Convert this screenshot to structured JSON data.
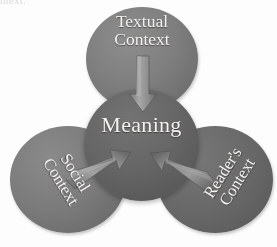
{
  "figure": {
    "cutoff_running_text": "ntext.",
    "background_color": "#fdfdfd"
  },
  "nodes": {
    "textual": {
      "label": "Textual\nContext",
      "fill_color": "#7e7e7e",
      "text_color": "#f4f3f0"
    },
    "meaning": {
      "label": "Meaning",
      "fill_color": "#666666",
      "text_color": "#f4f3f0"
    },
    "social": {
      "label": "Social\nContext",
      "fill_color": "#7b7b7b",
      "text_color": "#f4f3f0",
      "rotation_degrees": 58
    },
    "readers": {
      "label": "Reader's\nContext",
      "fill_color": "#696969",
      "text_color": "#f4f3f0",
      "rotation_degrees": -58
    }
  },
  "arrows": {
    "from_textual": {
      "name": "arrow-textual-to-meaning",
      "direction": "down",
      "color": "#9a9a9a"
    },
    "from_social": {
      "name": "arrow-social-to-meaning",
      "direction": "up-right",
      "color": "#8f8f8f"
    },
    "from_readers": {
      "name": "arrow-readers-to-meaning",
      "direction": "up-left",
      "color": "#8f8f8f"
    }
  }
}
